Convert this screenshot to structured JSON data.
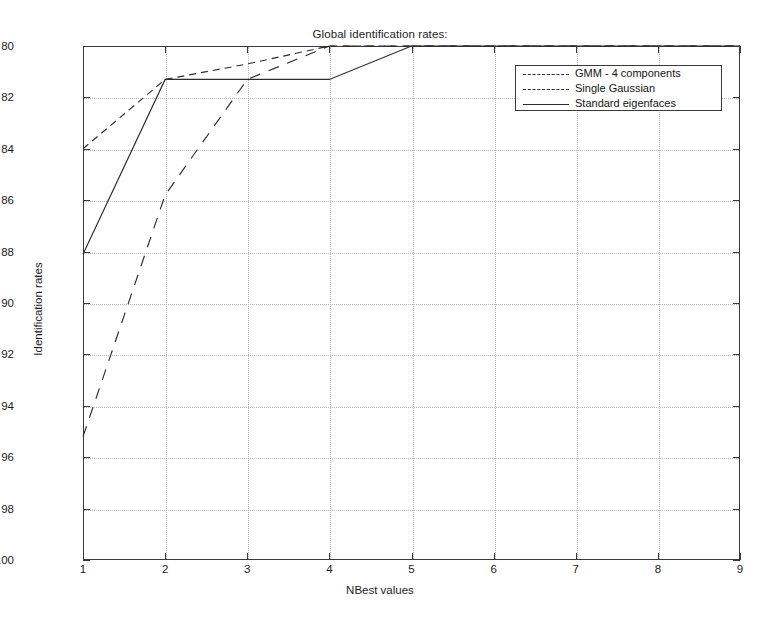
{
  "chart_data": {
    "type": "line",
    "title": "Global identification rates:",
    "xlabel": "NBest values",
    "ylabel": "Identification rates",
    "xlim": [
      1,
      9
    ],
    "ylim": [
      80,
      100
    ],
    "xticks": [
      1,
      2,
      3,
      4,
      5,
      6,
      7,
      8,
      9
    ],
    "yticks": [
      80,
      82,
      84,
      86,
      88,
      90,
      92,
      94,
      96,
      98,
      100
    ],
    "grid": true,
    "legend_position": "upper right",
    "x": [
      1,
      2,
      3,
      4,
      5,
      6,
      7,
      8,
      9
    ],
    "series": [
      {
        "name": "GMM - 4 components",
        "style": "dashed",
        "color": "#2c2c2c",
        "values": [
          96.0,
          98.7,
          99.3,
          100.0,
          100.0,
          100.0,
          100.0,
          100.0,
          100.0
        ]
      },
      {
        "name": "Single Gaussian",
        "style": "dashed-long",
        "color": "#2c2c2c",
        "values": [
          84.8,
          94.2,
          98.7,
          100.0,
          100.0,
          100.0,
          100.0,
          100.0,
          100.0
        ]
      },
      {
        "name": "Standard eigenfaces",
        "style": "solid",
        "color": "#2c2c2c",
        "values": [
          91.9,
          98.7,
          98.7,
          98.7,
          100.0,
          100.0,
          100.0,
          100.0,
          100.0
        ]
      }
    ]
  },
  "figure": {
    "title": "Global identification rates:",
    "xlabel": "NBest values",
    "ylabel": "Identification rates",
    "axis_color": "#3a3a3a",
    "grid_color": "#b9b9b9",
    "background": "#ffffff"
  },
  "legend": {
    "items": [
      {
        "label": "GMM - 4 components"
      },
      {
        "label": "Single Gaussian"
      },
      {
        "label": "Standard eigenfaces"
      }
    ]
  },
  "yticks": [
    {
      "label": "100"
    },
    {
      "label": "98"
    },
    {
      "label": "96"
    },
    {
      "label": "94"
    },
    {
      "label": "92"
    },
    {
      "label": "90"
    },
    {
      "label": "88"
    },
    {
      "label": "86"
    },
    {
      "label": "84"
    },
    {
      "label": "82"
    },
    {
      "label": "80"
    }
  ],
  "xticks": [
    {
      "label": "1"
    },
    {
      "label": "2"
    },
    {
      "label": "3"
    },
    {
      "label": "4"
    },
    {
      "label": "5"
    },
    {
      "label": "6"
    },
    {
      "label": "7"
    },
    {
      "label": "8"
    },
    {
      "label": "9"
    }
  ]
}
